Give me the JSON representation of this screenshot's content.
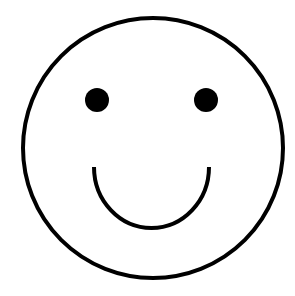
{
  "image": {
    "subject": "smiley-face",
    "background_color": "#ffffff",
    "stroke_color": "#000000",
    "face": {
      "cx": 153,
      "cy": 148,
      "r": 130,
      "stroke_width": 4
    },
    "eyes": [
      {
        "cx": 97,
        "cy": 100,
        "r": 12
      },
      {
        "cx": 206,
        "cy": 100,
        "r": 12
      }
    ],
    "mouth": {
      "start_x": 94,
      "start_y": 167,
      "end_x": 209,
      "end_y": 167,
      "bottom_y": 228,
      "stroke_width": 4
    }
  }
}
